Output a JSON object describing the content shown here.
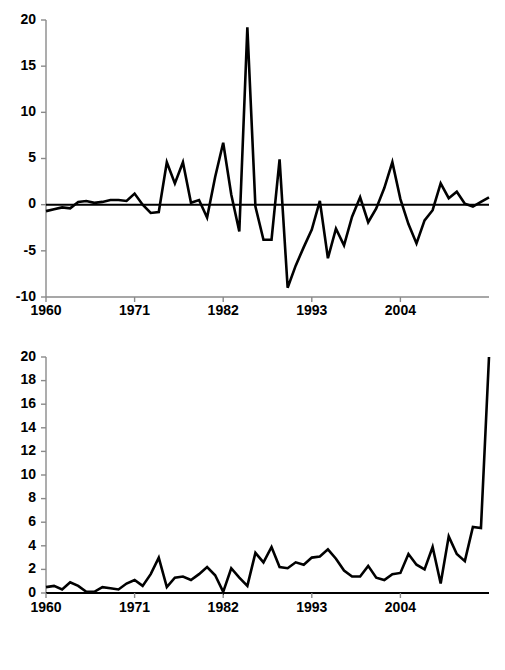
{
  "figure": {
    "background": "#ffffff",
    "line_color": "#000000",
    "axis_color": "#8a8a8a",
    "panel_count": 2
  },
  "chart_data": [
    {
      "id": "top-panel",
      "type": "line",
      "title": "",
      "subtitle": "",
      "xlabel": "",
      "ylabel": "",
      "grid": false,
      "legend": "none",
      "xlim": [
        1960,
        2015
      ],
      "ylim": [
        -10,
        20
      ],
      "yticks": [
        -10,
        -5,
        0,
        5,
        10,
        15,
        20
      ],
      "ytick_labels": [
        "-10",
        "-5",
        "0",
        "5",
        "10",
        "15",
        "20"
      ],
      "xticks": [
        1960,
        1971,
        1982,
        1993,
        2004
      ],
      "xtick_labels": [
        "1960",
        "1971",
        "1982",
        "1993",
        "2004"
      ],
      "zero_line": true,
      "x": [
        1960,
        1961,
        1962,
        1963,
        1964,
        1965,
        1966,
        1967,
        1968,
        1969,
        1970,
        1971,
        1972,
        1973,
        1974,
        1975,
        1976,
        1977,
        1978,
        1979,
        1980,
        1981,
        1982,
        1983,
        1984,
        1985,
        1986,
        1987,
        1988,
        1989,
        1990,
        1991,
        1992,
        1993,
        1994,
        1995,
        1996,
        1997,
        1998,
        1999,
        2000,
        2001,
        2002,
        2003,
        2004,
        2005,
        2006,
        2007,
        2008,
        2009,
        2010,
        2011,
        2012,
        2013,
        2014,
        2015
      ],
      "values": [
        -0.7,
        -0.5,
        -0.3,
        -0.4,
        0.3,
        0.4,
        0.2,
        0.3,
        0.5,
        0.5,
        0.4,
        1.2,
        0.0,
        -0.9,
        -0.8,
        4.6,
        2.3,
        4.6,
        0.2,
        0.5,
        -1.4,
        3.0,
        6.7,
        1.1,
        -2.9,
        19.2,
        -0.2,
        -3.8,
        -3.8,
        4.9,
        -9.0,
        -6.6,
        -4.6,
        -2.7,
        0.4,
        -5.8,
        -2.6,
        -4.4,
        -1.3,
        0.8,
        -1.9,
        -0.4,
        1.8,
        4.6,
        0.6,
        -2.1,
        -4.2,
        -1.7,
        -0.6,
        2.3,
        0.7,
        1.4,
        0.1,
        -0.2,
        0.3,
        0.8
      ]
    },
    {
      "id": "bottom-panel",
      "type": "line",
      "title": "",
      "subtitle": "",
      "xlabel": "",
      "ylabel": "",
      "grid": false,
      "legend": "none",
      "xlim": [
        1960,
        2015
      ],
      "ylim": [
        0,
        20
      ],
      "yticks": [
        0,
        2,
        4,
        6,
        8,
        10,
        12,
        14,
        16,
        18,
        20
      ],
      "ytick_labels": [
        "0",
        "2",
        "4",
        "6",
        "8",
        "10",
        "12",
        "14",
        "16",
        "18",
        "20"
      ],
      "xticks": [
        1960,
        1971,
        1982,
        1993,
        2004
      ],
      "xtick_labels": [
        "1960",
        "1971",
        "1982",
        "1993",
        "2004"
      ],
      "zero_line": true,
      "x": [
        1960,
        1961,
        1962,
        1963,
        1964,
        1965,
        1966,
        1967,
        1968,
        1969,
        1970,
        1971,
        1972,
        1973,
        1974,
        1975,
        1976,
        1977,
        1978,
        1979,
        1980,
        1981,
        1982,
        1983,
        1984,
        1985,
        1986,
        1987,
        1988,
        1989,
        1990,
        1991,
        1992,
        1993,
        1994,
        1995,
        1996,
        1997,
        1998,
        1999,
        2000,
        2001,
        2002,
        2003,
        2004,
        2005,
        2006,
        2007,
        2008,
        2009,
        2010,
        2011,
        2012,
        2013,
        2014,
        2015
      ],
      "values": [
        0.5,
        0.6,
        0.3,
        0.9,
        0.6,
        0.1,
        0.1,
        0.5,
        0.4,
        0.3,
        0.8,
        1.1,
        0.6,
        1.6,
        3.0,
        0.5,
        1.3,
        1.4,
        1.1,
        1.6,
        2.2,
        1.5,
        0.1,
        2.1,
        1.3,
        0.6,
        3.4,
        2.6,
        3.9,
        2.2,
        2.1,
        2.6,
        2.4,
        3.0,
        3.1,
        3.7,
        2.9,
        1.9,
        1.4,
        1.4,
        2.3,
        1.3,
        1.1,
        1.6,
        1.7,
        3.3,
        2.4,
        2.0,
        3.9,
        0.8,
        4.8,
        3.3,
        2.7,
        5.6,
        5.5,
        20.0
      ]
    }
  ]
}
